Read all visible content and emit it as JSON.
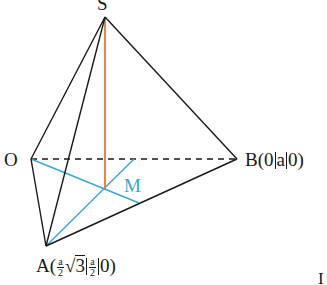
{
  "figure": {
    "type": "pyramid-diagram",
    "points": {
      "S": {
        "label": "S",
        "x": 105,
        "y": 17
      },
      "O": {
        "label": "O",
        "x": 31,
        "y": 159
      },
      "B": {
        "label": "B",
        "x": 237,
        "y": 159,
        "coords": [
          "0",
          "a",
          "0"
        ]
      },
      "A": {
        "label": "A",
        "x": 46,
        "y": 246,
        "coords": [
          "a/2·√3",
          "a/2",
          "0"
        ]
      },
      "M": {
        "label": "M",
        "x": 105,
        "y": 189
      }
    },
    "labels": {
      "S": "S",
      "O": "O",
      "M": "M",
      "B_letter": "B",
      "B_open": "(",
      "B_c1": "0",
      "B_c2": "a",
      "B_c3": "0",
      "B_close": ")",
      "A_letter": "A",
      "A_open": "(",
      "A_frac1_num": "a",
      "A_frac1_den": "2",
      "A_sqrt_sign": "√",
      "A_sqrt_arg": "3",
      "A_frac2_num": "a",
      "A_frac2_den": "2",
      "A_c3": "0",
      "A_close": ")",
      "corner_mark": "I"
    },
    "colors": {
      "edge": "#1a1a1a",
      "height": "#e8772a",
      "median": "#3aa6d8"
    }
  }
}
